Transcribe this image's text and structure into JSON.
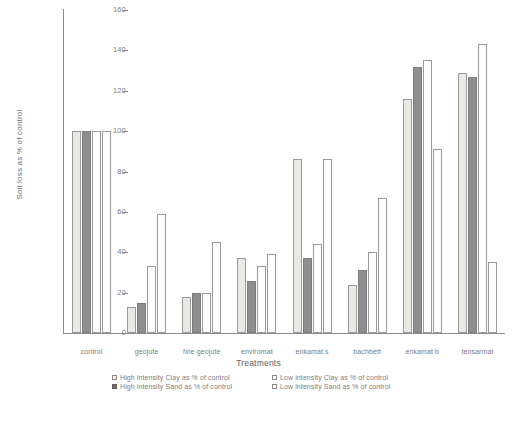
{
  "chart_data": {
    "type": "bar",
    "title": "",
    "xlabel": "Treatments",
    "ylabel": "Soil loss as % of control",
    "ylim": [
      0,
      160
    ],
    "yticks": [
      0,
      20,
      40,
      60,
      80,
      100,
      120,
      140,
      160
    ],
    "grid": false,
    "legend_position": "bottom",
    "categories": [
      "control",
      "geojute",
      "fine geojute",
      "enviromat",
      "enkamat s",
      "bachbett",
      "enkamat b",
      "tensarmat"
    ],
    "series": [
      {
        "name": "High intensity Clay as % of control",
        "color": "#e9e9e4",
        "values": [
          100,
          13,
          18,
          37,
          86,
          24,
          116,
          129
        ]
      },
      {
        "name": "High intensity Sand as % of control",
        "color": "#8e8e8e",
        "values": [
          100,
          15,
          20,
          26,
          37,
          31,
          132,
          127
        ]
      },
      {
        "name": "Low intensity Clay as % of control",
        "color": "#ffffff",
        "values": [
          100,
          33,
          20,
          33,
          44,
          40,
          135,
          143
        ]
      },
      {
        "name": "Low intensity Sand as % of control",
        "color": "#ffffff",
        "values": [
          100,
          59,
          45,
          39,
          86,
          67,
          91,
          35
        ]
      }
    ]
  },
  "axes": {
    "y_title": "Soil loss as % of control",
    "x_title": "Treatments",
    "y_tick_labels": [
      "160",
      "140",
      "120",
      "100",
      "80",
      "60",
      "40",
      "20",
      "0"
    ]
  },
  "legend": {
    "items": [
      {
        "label": "High intensity Clay as % of control",
        "swatch": "open-light-square-icon"
      },
      {
        "label": "Low intensity Clay as % of control",
        "swatch": "open-square-icon"
      },
      {
        "label": "High intensity Sand as % of control",
        "swatch": "filled-square-icon"
      },
      {
        "label": "Low intensity Sand as % of control",
        "swatch": "open-square-icon"
      }
    ]
  },
  "colors": {
    "high_clay": "#e9e9e4",
    "high_sand": "#8e8e8e",
    "low_clay": "#ffffff",
    "low_sand": "#ffffff",
    "axis": "#8d8d8d",
    "text": "#7b7b7b"
  }
}
